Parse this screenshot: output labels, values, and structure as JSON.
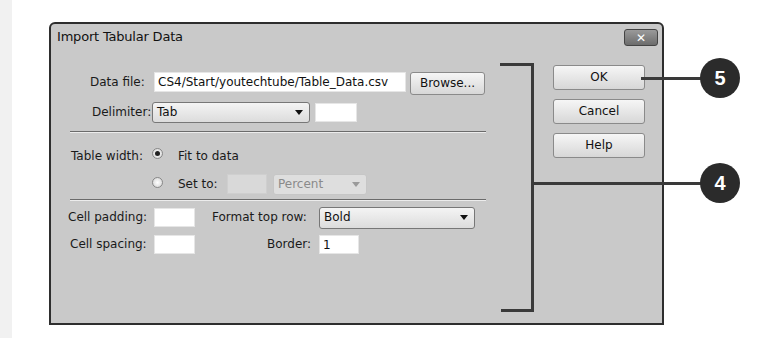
{
  "dialog": {
    "title": "Import Tabular Data",
    "close_glyph": "✕",
    "data_file": {
      "label": "Data file:",
      "value": "CS4/Start/youtechtube/Table_Data.csv"
    },
    "browse_label": "Browse...",
    "delimiter": {
      "label": "Delimiter:",
      "value": "Tab",
      "other_value": ""
    },
    "table_width": {
      "label": "Table width:",
      "options": [
        {
          "label": "Fit to data",
          "checked": true
        },
        {
          "label": "Set to:",
          "checked": false
        }
      ],
      "set_to_value": "",
      "unit_value": "Percent"
    },
    "cell_padding": {
      "label": "Cell padding:",
      "value": ""
    },
    "cell_spacing": {
      "label": "Cell spacing:",
      "value": ""
    },
    "format_top_row": {
      "label": "Format top row:",
      "value": "Bold"
    },
    "border": {
      "label": "Border:",
      "value": "1"
    },
    "buttons": {
      "ok": "OK",
      "cancel": "Cancel",
      "help": "Help"
    }
  },
  "callouts": [
    {
      "number": "5",
      "target": "ok-button"
    },
    {
      "number": "4",
      "target": "dialog-options-bracket"
    }
  ]
}
